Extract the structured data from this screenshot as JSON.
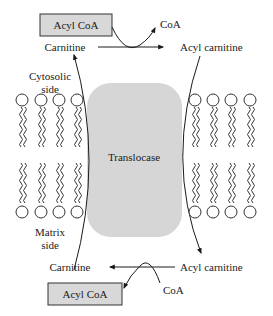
{
  "diagram": {
    "top": {
      "acyl_coa_box": "Acyl CoA",
      "coa": "CoA",
      "carnitine": "Carnitine",
      "acyl_carnitine": "Acyl carnitine"
    },
    "cytosolic_side": [
      "Cytosolic",
      "side"
    ],
    "translocase": "Translocase",
    "matrix_side": [
      "Matrix",
      "side"
    ],
    "bottom": {
      "carnitine": "Carnitine",
      "acyl_carnitine": "Acyl carnitine",
      "coa": "CoA",
      "acyl_coa_box": "Acyl CoA"
    },
    "colors": {
      "box_fill": "#d8d8d8",
      "translocase_fill": "#d6d6d6",
      "line": "#1a1a1a"
    }
  }
}
